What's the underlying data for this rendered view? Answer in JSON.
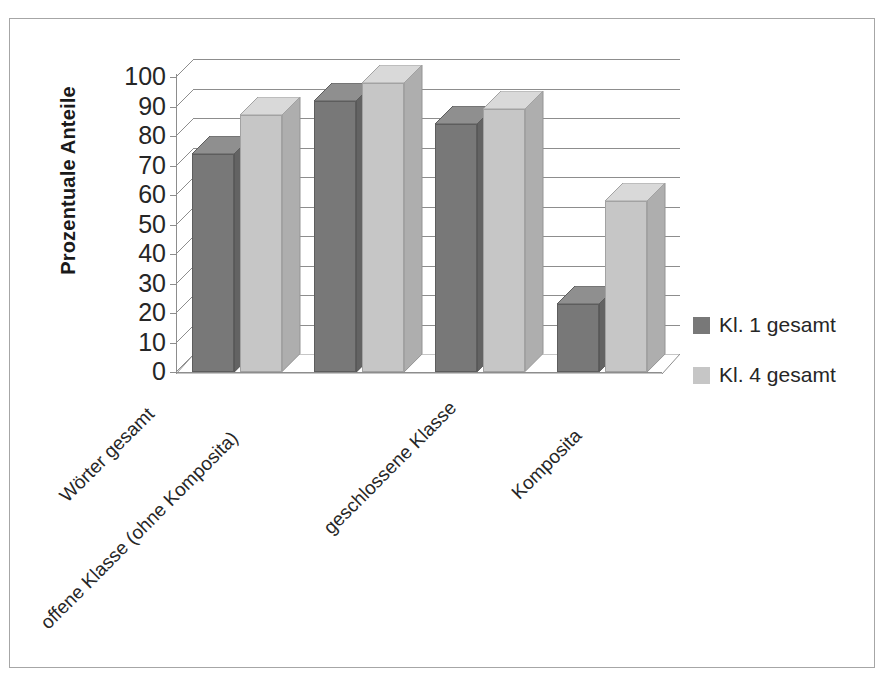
{
  "chart_data": {
    "type": "bar",
    "title": "",
    "xlabel": "",
    "ylabel": "Prozentuale Anteile",
    "ylim": [
      0,
      100
    ],
    "yticks": [
      0,
      10,
      20,
      30,
      40,
      50,
      60,
      70,
      80,
      90,
      100
    ],
    "grid": true,
    "legend_position": "right",
    "style": "3d-clustered-column",
    "categories": [
      "Wörter gesamt",
      "offene Klasse (ohne Komposita)",
      "geschlossene Klasse",
      "Komposita"
    ],
    "series": [
      {
        "name": "Kl. 1 gesamt",
        "color": "#787878",
        "values": [
          74,
          92,
          84,
          23
        ]
      },
      {
        "name": "Kl. 4 gesamt",
        "color": "#c6c6c6",
        "values": [
          87,
          98,
          89,
          58
        ]
      }
    ]
  },
  "axis": {
    "y_title": "Prozentuale Anteile",
    "tick_labels": [
      "100",
      "90",
      "80",
      "70",
      "60",
      "50",
      "40",
      "30",
      "20",
      "10",
      "0"
    ]
  },
  "legend": {
    "entries": [
      {
        "label": "Kl. 1 gesamt",
        "color": "#787878"
      },
      {
        "label": "Kl. 4 gesamt",
        "color": "#c6c6c6"
      }
    ]
  },
  "categories": [
    {
      "label": "Wörter gesamt"
    },
    {
      "label": "offene Klasse (ohne Komposita)"
    },
    {
      "label": "geschlossene Klasse"
    },
    {
      "label": "Komposita"
    }
  ]
}
